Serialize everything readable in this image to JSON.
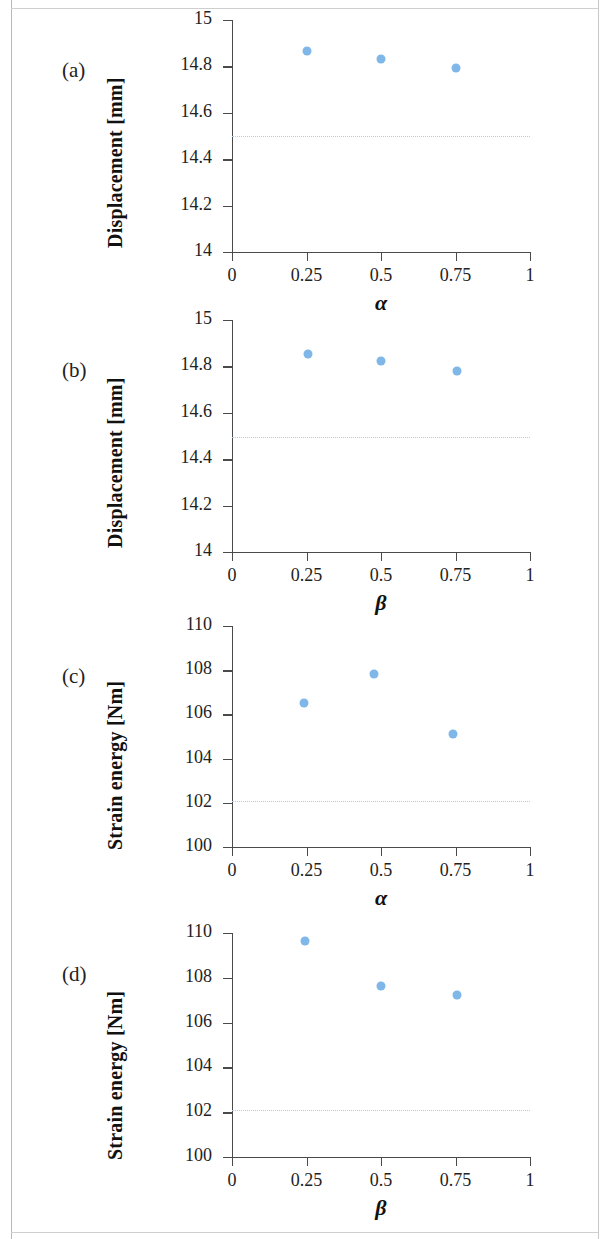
{
  "figure": {
    "marker_color": "#7fb7e8",
    "refline_color": "#a9cdea",
    "axis_color": "#4a4a4a"
  },
  "panels": [
    {
      "letter": "(a)",
      "ylabel": "Displacement [mm]",
      "xlabel": "α",
      "yticks": [
        "14",
        "14.2",
        "14.4",
        "14.6",
        "14.8",
        "15"
      ],
      "xticks": [
        "0",
        "0.25",
        "0.5",
        "0.75",
        "1"
      ]
    },
    {
      "letter": "(b)",
      "ylabel": "Displacement [mm]",
      "xlabel": "β",
      "yticks": [
        "14",
        "14.2",
        "14.4",
        "14.6",
        "14.8",
        "15"
      ],
      "xticks": [
        "0",
        "0.25",
        "0.5",
        "0.75",
        "1"
      ]
    },
    {
      "letter": "(c)",
      "ylabel": "Strain energy [Nm]",
      "xlabel": "α",
      "yticks": [
        "100",
        "102",
        "104",
        "106",
        "108",
        "110"
      ],
      "xticks": [
        "0",
        "0.25",
        "0.5",
        "0.75",
        "1"
      ]
    },
    {
      "letter": "(d)",
      "ylabel": "Strain energy [Nm]",
      "xlabel": "β",
      "yticks": [
        "100",
        "102",
        "104",
        "106",
        "108",
        "110"
      ],
      "xticks": [
        "0",
        "0.25",
        "0.5",
        "0.75",
        "1"
      ]
    }
  ],
  "chart_data": [
    {
      "type": "scatter",
      "panel": "(a)",
      "title": "",
      "xlabel": "α",
      "ylabel": "Displacement [mm]",
      "x": [
        0.25,
        0.5,
        0.75
      ],
      "y": [
        14.865,
        14.83,
        14.795
      ],
      "xlim": [
        0,
        1
      ],
      "ylim": [
        14,
        15
      ],
      "xticks": [
        0,
        0.25,
        0.5,
        0.75,
        1
      ],
      "yticks": [
        14,
        14.2,
        14.4,
        14.6,
        14.8,
        15
      ],
      "grid": false,
      "legend": "none",
      "reference_line": {
        "orientation": "horizontal",
        "value": 14.5,
        "style": "dotted"
      }
    },
    {
      "type": "scatter",
      "panel": "(b)",
      "title": "",
      "xlabel": "β",
      "ylabel": "Displacement [mm]",
      "x": [
        0.255,
        0.5,
        0.755
      ],
      "y": [
        14.855,
        14.825,
        14.78
      ],
      "xlim": [
        0,
        1
      ],
      "ylim": [
        14,
        15
      ],
      "xticks": [
        0,
        0.25,
        0.5,
        0.75,
        1
      ],
      "yticks": [
        14,
        14.2,
        14.4,
        14.6,
        14.8,
        15
      ],
      "grid": false,
      "legend": "none",
      "reference_line": {
        "orientation": "horizontal",
        "value": 14.495,
        "style": "dotted"
      }
    },
    {
      "type": "scatter",
      "panel": "(c)",
      "title": "",
      "xlabel": "α",
      "ylabel": "Strain energy [Nm]",
      "x": [
        0.24,
        0.475,
        0.74
      ],
      "y": [
        106.5,
        107.85,
        105.1
      ],
      "xlim": [
        0,
        1
      ],
      "ylim": [
        100,
        110
      ],
      "xticks": [
        0,
        0.25,
        0.5,
        0.75,
        1
      ],
      "yticks": [
        100,
        102,
        104,
        106,
        108,
        110
      ],
      "grid": false,
      "legend": "none",
      "reference_line": {
        "orientation": "horizontal",
        "value": 102.1,
        "style": "dotted"
      }
    },
    {
      "type": "scatter",
      "panel": "(d)",
      "title": "",
      "xlabel": "β",
      "ylabel": "Strain energy [Nm]",
      "x": [
        0.245,
        0.5,
        0.755
      ],
      "y": [
        109.65,
        107.65,
        107.25
      ],
      "xlim": [
        0,
        1
      ],
      "ylim": [
        100,
        110
      ],
      "xticks": [
        0,
        0.25,
        0.5,
        0.75,
        1
      ],
      "yticks": [
        100,
        102,
        104,
        106,
        108,
        110
      ],
      "grid": false,
      "legend": "none",
      "reference_line": {
        "orientation": "horizontal",
        "value": 102.1,
        "style": "dotted"
      }
    }
  ]
}
